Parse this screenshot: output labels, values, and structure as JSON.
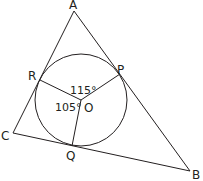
{
  "diagram": {
    "type": "geometry-incircle",
    "colors": {
      "stroke": "#231f20",
      "background": "#ffffff"
    },
    "points": {
      "A": {
        "label": "A",
        "x": 74,
        "y": 11
      },
      "B": {
        "label": "B",
        "x": 190,
        "y": 171
      },
      "C": {
        "label": "C",
        "x": 13,
        "y": 133
      },
      "O": {
        "label": "O",
        "x": 81,
        "y": 100
      },
      "P": {
        "label": "P",
        "x": 120,
        "y": 74
      },
      "Q": {
        "label": "Q",
        "x": 72,
        "y": 146
      },
      "R": {
        "label": "R",
        "x": 40,
        "y": 80
      }
    },
    "circle": {
      "center": "O",
      "cx": 81,
      "cy": 100,
      "r": 46
    },
    "segments": [
      [
        "A",
        "B"
      ],
      [
        "B",
        "C"
      ],
      [
        "C",
        "A"
      ],
      [
        "O",
        "R"
      ],
      [
        "O",
        "P"
      ],
      [
        "O",
        "Q"
      ]
    ],
    "angles": {
      "ROP": {
        "label": "115°",
        "value": 115
      },
      "ROQ": {
        "label": "105°",
        "value": 105
      }
    }
  }
}
